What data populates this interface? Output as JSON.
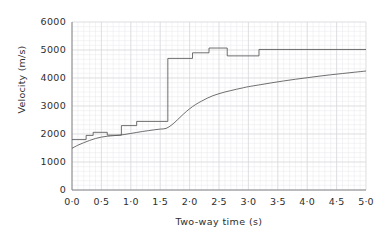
{
  "chart_data": {
    "type": "line",
    "title": "",
    "xlabel": "Two-way time (s)",
    "ylabel": "Velocity (m/s)",
    "xlim": [
      0.0,
      5.0
    ],
    "ylim": [
      0,
      6000
    ],
    "grid": true,
    "legend": "none",
    "xticks": [
      "0·0",
      "0·5",
      "1·0",
      "1·5",
      "2·0",
      "2·5",
      "3·0",
      "3·5",
      "4·0",
      "4·5",
      "5·0"
    ],
    "xtick_values": [
      0.0,
      0.5,
      1.0,
      1.5,
      2.0,
      2.5,
      3.0,
      3.5,
      4.0,
      4.5,
      5.0
    ],
    "yticks": [
      "0",
      "1000",
      "2000",
      "3000",
      "4000",
      "5000",
      "6000"
    ],
    "ytick_values": [
      0,
      1000,
      2000,
      3000,
      4000,
      5000,
      6000
    ],
    "series": [
      {
        "name": "interval-velocity-step",
        "style": "step",
        "color": "#555555",
        "points": [
          [
            0.0,
            1800
          ],
          [
            0.24,
            1800
          ],
          [
            0.24,
            1950
          ],
          [
            0.36,
            1950
          ],
          [
            0.36,
            2060
          ],
          [
            0.6,
            2060
          ],
          [
            0.6,
            1960
          ],
          [
            0.84,
            1960
          ],
          [
            0.84,
            2300
          ],
          [
            1.1,
            2300
          ],
          [
            1.1,
            2450
          ],
          [
            1.63,
            2450
          ],
          [
            1.63,
            4700
          ],
          [
            2.05,
            4700
          ],
          [
            2.05,
            4900
          ],
          [
            2.33,
            4900
          ],
          [
            2.33,
            5070
          ],
          [
            2.64,
            5070
          ],
          [
            2.64,
            4790
          ],
          [
            3.18,
            4790
          ],
          [
            3.18,
            5020
          ],
          [
            5.0,
            5020
          ]
        ]
      },
      {
        "name": "rms-velocity-smooth",
        "style": "smooth",
        "color": "#555555",
        "points": [
          [
            0.0,
            1490
          ],
          [
            0.1,
            1600
          ],
          [
            0.2,
            1690
          ],
          [
            0.3,
            1770
          ],
          [
            0.4,
            1840
          ],
          [
            0.5,
            1890
          ],
          [
            0.6,
            1920
          ],
          [
            0.7,
            1940
          ],
          [
            0.8,
            1955
          ],
          [
            0.9,
            1985
          ],
          [
            1.0,
            2020
          ],
          [
            1.1,
            2055
          ],
          [
            1.2,
            2090
          ],
          [
            1.3,
            2120
          ],
          [
            1.4,
            2150
          ],
          [
            1.5,
            2175
          ],
          [
            1.6,
            2200
          ],
          [
            1.7,
            2330
          ],
          [
            1.8,
            2520
          ],
          [
            1.9,
            2720
          ],
          [
            2.0,
            2900
          ],
          [
            2.1,
            3050
          ],
          [
            2.2,
            3170
          ],
          [
            2.3,
            3280
          ],
          [
            2.4,
            3370
          ],
          [
            2.5,
            3440
          ],
          [
            2.6,
            3500
          ],
          [
            2.7,
            3550
          ],
          [
            2.8,
            3600
          ],
          [
            2.9,
            3645
          ],
          [
            3.0,
            3690
          ],
          [
            3.2,
            3760
          ],
          [
            3.4,
            3830
          ],
          [
            3.6,
            3895
          ],
          [
            3.8,
            3955
          ],
          [
            4.0,
            4010
          ],
          [
            4.2,
            4065
          ],
          [
            4.4,
            4115
          ],
          [
            4.6,
            4160
          ],
          [
            4.8,
            4205
          ],
          [
            5.0,
            4250
          ]
        ]
      }
    ]
  },
  "axes": {
    "y_title": "Velocity (m/s)",
    "x_title": "Two-way time (s)"
  }
}
